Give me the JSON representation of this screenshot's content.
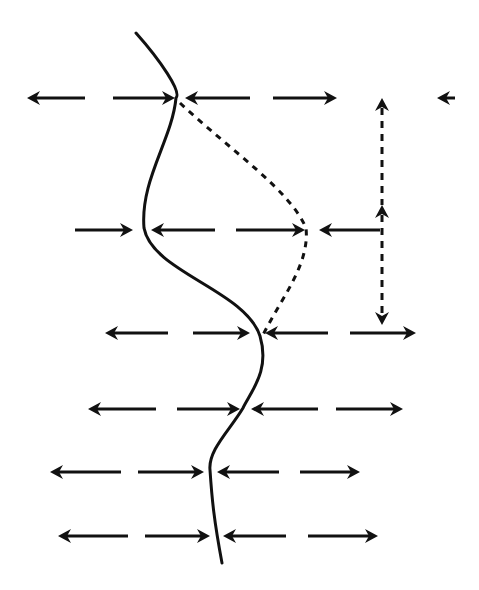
{
  "diagram": {
    "width": 479,
    "height": 590,
    "colors": {
      "ink": "#111111",
      "background": "#ffffff"
    },
    "solid_curve": {
      "name": "wavy-interface-line",
      "path": "M136,33 C160,60 182,92 176,98 C172,140 140,180 144,228 C152,272 245,290 260,336 C270,370 252,390 243,408 C230,430 208,450 210,470 C212,500 214,520 222,563"
    },
    "dotted_curve": {
      "name": "displacement-envelope",
      "path": "M180,103 C230,150 290,190 306,228 C310,265 280,300 263,335"
    },
    "vertical_arrows": [
      {
        "name": "upper-vertical-double-arrow",
        "x": 382,
        "y1": 98,
        "y2": 205,
        "head_start": true,
        "head_end": false
      },
      {
        "name": "lower-vertical-double-arrow",
        "x": 382,
        "y1": 205,
        "y2": 325,
        "head_start": true,
        "head_end": true
      }
    ],
    "horizontal_arrows": [
      {
        "row": 1,
        "x1": 85,
        "x2": 27,
        "y": 98
      },
      {
        "row": 1,
        "x1": 113,
        "x2": 175,
        "y": 98
      },
      {
        "row": 1,
        "x1": 250,
        "x2": 185,
        "y": 98
      },
      {
        "row": 1,
        "x1": 273,
        "x2": 337,
        "y": 98
      },
      {
        "row": 1,
        "x1": 455,
        "x2": 437,
        "y": 98
      },
      {
        "row": 2,
        "x1": 75,
        "x2": 133,
        "y": 230
      },
      {
        "row": 2,
        "x1": 215,
        "x2": 151,
        "y": 230
      },
      {
        "row": 2,
        "x1": 236,
        "x2": 305,
        "y": 230
      },
      {
        "row": 2,
        "x1": 380,
        "x2": 319,
        "y": 230
      },
      {
        "row": 3,
        "x1": 168,
        "x2": 105,
        "y": 333
      },
      {
        "row": 3,
        "x1": 193,
        "x2": 250,
        "y": 333
      },
      {
        "row": 3,
        "x1": 328,
        "x2": 265,
        "y": 333
      },
      {
        "row": 3,
        "x1": 350,
        "x2": 416,
        "y": 333
      },
      {
        "row": 4,
        "x1": 156,
        "x2": 88,
        "y": 409
      },
      {
        "row": 4,
        "x1": 177,
        "x2": 240,
        "y": 409
      },
      {
        "row": 4,
        "x1": 318,
        "x2": 251,
        "y": 409
      },
      {
        "row": 4,
        "x1": 336,
        "x2": 403,
        "y": 409
      },
      {
        "row": 5,
        "x1": 121,
        "x2": 50,
        "y": 472
      },
      {
        "row": 5,
        "x1": 138,
        "x2": 204,
        "y": 472
      },
      {
        "row": 5,
        "x1": 279,
        "x2": 217,
        "y": 472
      },
      {
        "row": 5,
        "x1": 300,
        "x2": 360,
        "y": 472
      },
      {
        "row": 6,
        "x1": 128,
        "x2": 58,
        "y": 536
      },
      {
        "row": 6,
        "x1": 145,
        "x2": 210,
        "y": 536
      },
      {
        "row": 6,
        "x1": 286,
        "x2": 223,
        "y": 536
      },
      {
        "row": 6,
        "x1": 308,
        "x2": 378,
        "y": 536
      }
    ]
  }
}
